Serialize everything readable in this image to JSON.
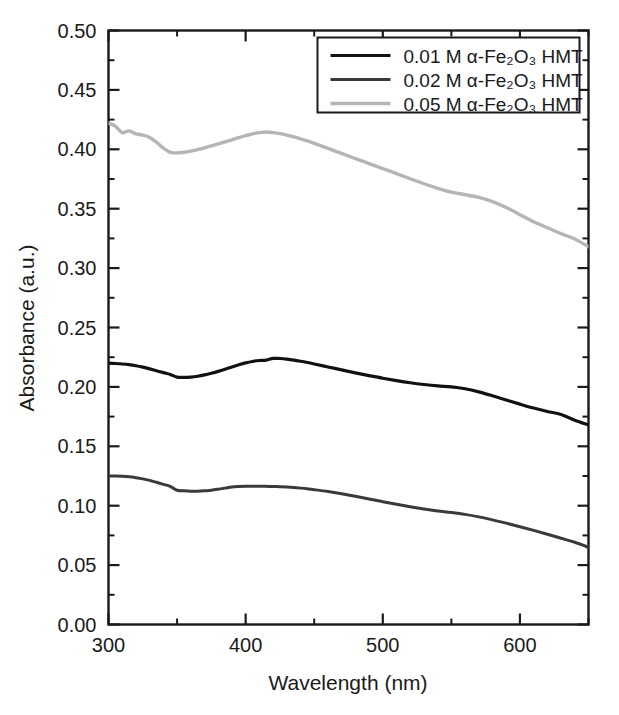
{
  "chart_data": {
    "type": "line",
    "title": "",
    "xlabel": "Wavelength (nm)",
    "ylabel": "Absorbance (a.u.)",
    "xlim": [
      300,
      650
    ],
    "ylim": [
      0.0,
      0.5
    ],
    "grid": false,
    "legend_position": "top-right",
    "x_ticks": [
      300,
      400,
      500,
      600
    ],
    "x_tick_labels": [
      "300",
      "400",
      "500",
      "600"
    ],
    "x_minor_ticks": [
      350,
      450,
      550,
      650
    ],
    "y_ticks": [
      0.0,
      0.05,
      0.1,
      0.15,
      0.2,
      0.25,
      0.3,
      0.35,
      0.4,
      0.45,
      0.5
    ],
    "y_tick_labels": [
      "0.00",
      "0.05",
      "0.10",
      "0.15",
      "0.20",
      "0.25",
      "0.30",
      "0.35",
      "0.40",
      "0.45",
      "0.50"
    ],
    "y_minor_ticks": [
      0.025,
      0.075,
      0.125,
      0.175,
      0.225,
      0.275,
      0.325,
      0.375,
      0.425,
      0.475
    ],
    "x": [
      300,
      305,
      310,
      315,
      320,
      325,
      330,
      335,
      340,
      345,
      350,
      355,
      360,
      365,
      370,
      375,
      380,
      385,
      390,
      395,
      400,
      405,
      410,
      415,
      420,
      425,
      430,
      435,
      440,
      445,
      450,
      460,
      470,
      480,
      490,
      500,
      510,
      520,
      530,
      540,
      550,
      560,
      570,
      580,
      590,
      600,
      610,
      620,
      630,
      640,
      650
    ],
    "series": [
      {
        "name": "0.01 M α-Fe₂O₃ HMT",
        "color": "#111111",
        "linewidth": 3.2,
        "values": [
          0.22,
          0.2197,
          0.2193,
          0.2187,
          0.2178,
          0.2166,
          0.2152,
          0.2136,
          0.212,
          0.2105,
          0.2082,
          0.208,
          0.2083,
          0.209,
          0.2101,
          0.2115,
          0.2131,
          0.2149,
          0.2168,
          0.2186,
          0.2202,
          0.2214,
          0.2222,
          0.2226,
          0.224,
          0.2239,
          0.2234,
          0.2226,
          0.2216,
          0.2205,
          0.2193,
          0.2168,
          0.2143,
          0.2118,
          0.2095,
          0.2073,
          0.2053,
          0.2035,
          0.202,
          0.2008,
          0.2,
          0.1984,
          0.1958,
          0.1925,
          0.189,
          0.1855,
          0.1822,
          0.1793,
          0.1768,
          0.172,
          0.168
        ]
      },
      {
        "name": "0.02 M α-Fe₂O₃ HMT",
        "color": "#3a3a3a",
        "linewidth": 3.0,
        "values": [
          0.125,
          0.1249,
          0.1247,
          0.1243,
          0.1236,
          0.1226,
          0.1213,
          0.1197,
          0.118,
          0.1163,
          0.113,
          0.1125,
          0.1122,
          0.1122,
          0.1125,
          0.1131,
          0.1139,
          0.1148,
          0.1157,
          0.1161,
          0.1163,
          0.1164,
          0.1164,
          0.1163,
          0.1162,
          0.116,
          0.1157,
          0.1153,
          0.1148,
          0.1142,
          0.1135,
          0.1119,
          0.11,
          0.1079,
          0.1057,
          0.1034,
          0.1012,
          0.0991,
          0.0972,
          0.0956,
          0.0943,
          0.0927,
          0.0906,
          0.0881,
          0.0853,
          0.0823,
          0.0792,
          0.076,
          0.0726,
          0.0692,
          0.065
        ]
      },
      {
        "name": "0.05 M α-Fe₂O₃ HMT",
        "color": "#b5b5b5",
        "linewidth": 3.4,
        "values": [
          0.422,
          0.4195,
          0.414,
          0.4155,
          0.413,
          0.412,
          0.41,
          0.406,
          0.401,
          0.3975,
          0.397,
          0.3975,
          0.3985,
          0.3998,
          0.4012,
          0.4028,
          0.4045,
          0.4062,
          0.408,
          0.4098,
          0.4115,
          0.413,
          0.414,
          0.4145,
          0.414,
          0.4132,
          0.412,
          0.4105,
          0.4088,
          0.407,
          0.405,
          0.4008,
          0.3965,
          0.3922,
          0.388,
          0.3838,
          0.3795,
          0.3752,
          0.371,
          0.3672,
          0.364,
          0.3618,
          0.3595,
          0.356,
          0.351,
          0.345,
          0.339,
          0.334,
          0.329,
          0.3245,
          0.318
        ]
      }
    ]
  },
  "legend": {
    "entries": [
      {
        "label": "0.01 M α-Fe₂O₃ HMT"
      },
      {
        "label": "0.02 M α-Fe₂O₃ HMT"
      },
      {
        "label": "0.05 M α-Fe₂O₃ HMT"
      }
    ]
  },
  "axes": {
    "x_title": "Wavelength (nm)",
    "y_title": "Absorbance (a.u.)"
  },
  "colors": {
    "series_1": "#111111",
    "series_2": "#3a3a3a",
    "series_3": "#b5b5b5",
    "axis": "#1a1a1a",
    "background": "#ffffff"
  }
}
